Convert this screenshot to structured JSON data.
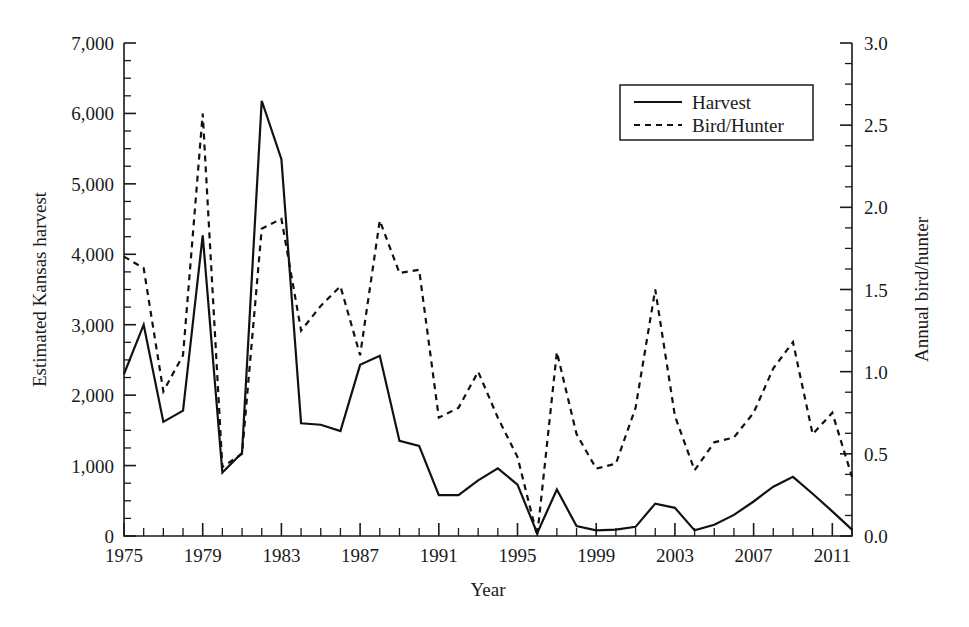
{
  "chart_data": {
    "type": "line",
    "title": "",
    "xlabel": "Year",
    "ylabel": "Estimated Kansas harvest",
    "y2label": "Annual bird/hunter",
    "xlim": [
      1975,
      2012
    ],
    "ylim": [
      0,
      7000
    ],
    "y2lim": [
      0.0,
      3.0
    ],
    "grid": false,
    "legend_position": "top-right",
    "x": [
      1975,
      1976,
      1977,
      1978,
      1979,
      1980,
      1981,
      1982,
      1983,
      1984,
      1985,
      1986,
      1987,
      1988,
      1989,
      1990,
      1991,
      1992,
      1993,
      1994,
      1995,
      1996,
      1997,
      1998,
      1999,
      2000,
      2001,
      2002,
      2003,
      2004,
      2005,
      2006,
      2007,
      2008,
      2009,
      2010,
      2011,
      2012
    ],
    "xticklabels_major": [
      "1975",
      "1979",
      "1983",
      "1987",
      "1991",
      "1995",
      "1999",
      "2003",
      "2007",
      "2011"
    ],
    "yticklabels": [
      "0",
      "1,000",
      "2,000",
      "3,000",
      "4,000",
      "5,000",
      "6,000",
      "7,000"
    ],
    "y2ticklabels": [
      "0.0",
      "0.5",
      "1.0",
      "1.5",
      "2.0",
      "2.5",
      "3.0"
    ],
    "series": [
      {
        "name": "Harvest",
        "axis": "left",
        "style": "solid",
        "values": [
          2300,
          3000,
          1620,
          1780,
          4270,
          900,
          1180,
          6180,
          5350,
          1600,
          1580,
          1490,
          2430,
          2560,
          1350,
          1280,
          580,
          580,
          790,
          960,
          730,
          40,
          660,
          140,
          80,
          90,
          130,
          460,
          400,
          80,
          160,
          300,
          490,
          700,
          840,
          600,
          350,
          90
        ]
      },
      {
        "name": "Bird/Hunter",
        "axis": "right",
        "style": "dashed",
        "values": [
          1.7,
          1.63,
          0.88,
          1.1,
          2.57,
          0.42,
          0.5,
          1.87,
          1.93,
          1.25,
          1.4,
          1.52,
          1.1,
          1.92,
          1.6,
          1.62,
          0.72,
          0.78,
          1.0,
          0.72,
          0.48,
          0.0,
          1.12,
          0.62,
          0.41,
          0.44,
          0.78,
          1.5,
          0.73,
          0.4,
          0.57,
          0.6,
          0.75,
          1.02,
          1.18,
          0.62,
          0.75,
          0.36
        ]
      }
    ]
  },
  "legend": {
    "entries": [
      {
        "label": "Harvest",
        "style": "solid"
      },
      {
        "label": "Bird/Hunter",
        "style": "dashed"
      }
    ]
  }
}
